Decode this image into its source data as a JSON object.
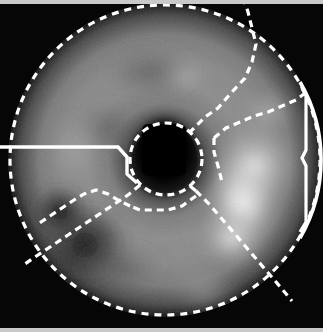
{
  "view": {
    "title": "Cardiac Polar Map",
    "width": 323,
    "height": 332,
    "background_color": "#060606",
    "frame_strip_color": "#c9c9c9",
    "overlay_color": "#ffffff",
    "modality_label": "grayscale perfusion polar map"
  },
  "chart_data": {
    "type": "heatmap",
    "subtype": "polar-bullseye",
    "subtitle": "",
    "xlabel": "",
    "ylabel": "",
    "grid": false,
    "legend_position": "none",
    "colormap": "grayscale",
    "value_range": [
      0,
      100
    ],
    "center": {
      "x": 165,
      "y": 160
    },
    "outer_radius": 158,
    "mid_radius": 104,
    "inner_radius": 34,
    "rings": [
      {
        "name": "apical",
        "r_inner": 0,
        "r_outer": 34,
        "label": "apex-cavity"
      },
      {
        "name": "mid",
        "r_inner": 34,
        "r_outer": 104,
        "label": "mid-ring"
      },
      {
        "name": "basal",
        "r_inner": 104,
        "r_outer": 158,
        "label": "basal-ring"
      }
    ],
    "segments": [
      {
        "id": 1,
        "name": "anterior",
        "angle_start": 240,
        "angle_end": 300,
        "ring": "basal",
        "value": 58,
        "gray": "#8b8b8b"
      },
      {
        "id": 2,
        "name": "anterolateral",
        "angle_start": 300,
        "angle_end": 345,
        "ring": "basal",
        "value": 62,
        "gray": "#949494"
      },
      {
        "id": 3,
        "name": "lateral",
        "angle_start": 345,
        "angle_end": 30,
        "ring": "basal",
        "value": 88,
        "gray": "#e2e2e2"
      },
      {
        "id": 4,
        "name": "inferolateral",
        "angle_start": 30,
        "angle_end": 75,
        "ring": "basal",
        "value": 70,
        "gray": "#adadad"
      },
      {
        "id": 5,
        "name": "inferior",
        "angle_start": 75,
        "angle_end": 130,
        "ring": "basal",
        "value": 52,
        "gray": "#7e7e7e"
      },
      {
        "id": 6,
        "name": "inferoseptal",
        "angle_start": 130,
        "angle_end": 180,
        "ring": "basal",
        "value": 30,
        "gray": "#4a4a4a"
      },
      {
        "id": 7,
        "name": "anteroseptal",
        "angle_start": 180,
        "angle_end": 240,
        "ring": "basal",
        "value": 56,
        "gray": "#878787"
      },
      {
        "id": 8,
        "name": "mid-anterior",
        "angle_start": 240,
        "angle_end": 330,
        "ring": "mid",
        "value": 54,
        "gray": "#828282"
      },
      {
        "id": 9,
        "name": "mid-lateral",
        "angle_start": 330,
        "angle_end": 60,
        "ring": "mid",
        "value": 80,
        "gray": "#cfcfcf"
      },
      {
        "id": 10,
        "name": "mid-inferior",
        "angle_start": 60,
        "angle_end": 150,
        "ring": "mid",
        "value": 48,
        "gray": "#767676"
      },
      {
        "id": 11,
        "name": "mid-septal",
        "angle_start": 150,
        "angle_end": 240,
        "ring": "mid",
        "value": 50,
        "gray": "#7a7a7a"
      },
      {
        "id": 12,
        "name": "apical-cavity",
        "angle_start": 0,
        "angle_end": 360,
        "ring": "apical",
        "value": 4,
        "gray": "#0d0d0d"
      }
    ],
    "hotspot": {
      "name": "lateral-wall-hotspot",
      "x": 243,
      "y": 200,
      "value": 100,
      "gray": "#ffffff"
    },
    "defect": {
      "name": "inferoseptal-defect",
      "x": 85,
      "y": 245,
      "value": 22,
      "gray": "#383838"
    },
    "boundary_lines": [
      {
        "name": "outer-contour",
        "style": "dashed",
        "color": "#ffffff"
      },
      {
        "name": "right-lateral-contour",
        "style": "solid",
        "color": "#ffffff"
      },
      {
        "name": "inner-cavity-contour",
        "style": "dashed",
        "color": "#ffffff"
      },
      {
        "name": "radial-180-left",
        "style": "solid",
        "color": "#ffffff",
        "angle": 180
      },
      {
        "name": "radial-upper-right",
        "style": "dashed",
        "color": "#ffffff",
        "angle": 315
      },
      {
        "name": "radial-lower-right",
        "style": "dashed",
        "color": "#ffffff",
        "angle": 45
      },
      {
        "name": "radial-lower-left",
        "style": "dashed",
        "color": "#ffffff",
        "angle": 125
      }
    ]
  }
}
